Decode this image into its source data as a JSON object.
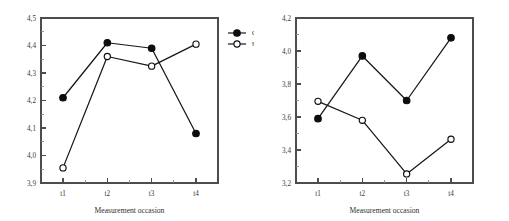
{
  "figure": {
    "legend": {
      "entries": [
        {
          "label": "deceased",
          "marker": "filled-circle"
        },
        {
          "label": "survivor",
          "marker": "open-circle"
        }
      ]
    }
  },
  "chart_data": [
    {
      "type": "line",
      "panel": "left",
      "title": "",
      "xlabel": "Measurement occasion",
      "ylabel": "",
      "categories": [
        "t1",
        "t2",
        "t3",
        "t4"
      ],
      "ylim": [
        3.9,
        4.5
      ],
      "ytick_labels": [
        "3,9",
        "4,0",
        "4,1",
        "4,2",
        "4,3",
        "4,4",
        "4,5"
      ],
      "ytick_values": [
        3.9,
        4.0,
        4.1,
        4.2,
        4.3,
        4.4,
        4.5
      ],
      "yminor_step": 0.05,
      "grid": false,
      "legend_position": "right-outside",
      "series": [
        {
          "name": "deceased",
          "marker": "filled-circle",
          "values": [
            4.21,
            4.41,
            4.39,
            4.08
          ]
        },
        {
          "name": "survivor",
          "marker": "open-circle",
          "values": [
            3.955,
            4.36,
            4.325,
            4.405
          ]
        }
      ]
    },
    {
      "type": "line",
      "panel": "right",
      "title": "",
      "xlabel": "Measurement occasion",
      "ylabel": "",
      "categories": [
        "t1",
        "t2",
        "t3",
        "t4"
      ],
      "ylim": [
        3.2,
        4.2
      ],
      "ytick_labels": [
        "3,2",
        "3,4",
        "3,6",
        "3,8",
        "4,0",
        "4,2"
      ],
      "ytick_values": [
        3.2,
        3.4,
        3.6,
        3.8,
        4.0,
        4.2
      ],
      "yminor_step": 0.1,
      "grid": false,
      "legend_position": "none",
      "series": [
        {
          "name": "deceased",
          "marker": "filled-circle",
          "values": [
            3.59,
            3.97,
            3.7,
            4.08
          ]
        },
        {
          "name": "survivor",
          "marker": "open-circle",
          "values": [
            3.695,
            3.58,
            3.255,
            3.465
          ]
        }
      ]
    }
  ]
}
